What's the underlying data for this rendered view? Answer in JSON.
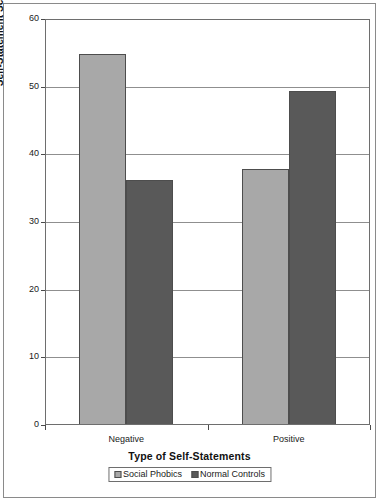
{
  "chart_data": {
    "type": "bar",
    "title": "",
    "xlabel": "Type of Self-Statements",
    "ylabel": "Self-Statement Score",
    "categories": [
      "Negative",
      "Positive"
    ],
    "series": [
      {
        "name": "Social Phobics",
        "values": [
          54.8,
          37.8
        ],
        "color": "#a8a8a8"
      },
      {
        "name": "Normal Controls",
        "values": [
          36.2,
          49.3
        ],
        "color": "#595959"
      }
    ],
    "ylim": [
      0,
      60
    ],
    "yticks": [
      0,
      10,
      20,
      30,
      40,
      50,
      60
    ],
    "ytick_labels": [
      "0",
      "10",
      "20",
      "30",
      "40",
      "50",
      "60"
    ],
    "grid": true,
    "legend_position": "bottom"
  },
  "axes": {
    "y_label": "Self-Statement Score",
    "x_label": "Type of Self-Statements",
    "y_ticks": [
      {
        "value": 60,
        "label": "60"
      },
      {
        "value": 50,
        "label": "50"
      },
      {
        "value": 40,
        "label": "40"
      },
      {
        "value": 30,
        "label": "30"
      },
      {
        "value": 20,
        "label": "20"
      },
      {
        "value": 10,
        "label": "10"
      },
      {
        "value": 0,
        "label": "0"
      }
    ],
    "x_categories": [
      {
        "label": "Negative"
      },
      {
        "label": "Positive"
      }
    ]
  },
  "legend": {
    "entries": [
      {
        "label": "Social Phobics",
        "color": "#a8a8a8"
      },
      {
        "label": "Normal Controls",
        "color": "#595959"
      }
    ]
  },
  "colors": {
    "series_light": "#a8a8a8",
    "series_dark": "#595959",
    "grid": "#8f8f8f",
    "axis": "#6e6e6e",
    "text": "#1a1a1a"
  }
}
